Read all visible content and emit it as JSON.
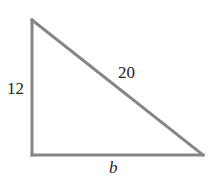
{
  "diagram": {
    "type": "right-triangle",
    "colors": {
      "stroke": "#858585",
      "label": "#222222",
      "background": "#ffffff"
    },
    "vertices": {
      "top": [
        32,
        20
      ],
      "right_angle": [
        32,
        155
      ],
      "right": [
        203,
        155
      ]
    },
    "labels": {
      "vertical_leg": "12",
      "hypotenuse": "20",
      "base": "b"
    }
  }
}
